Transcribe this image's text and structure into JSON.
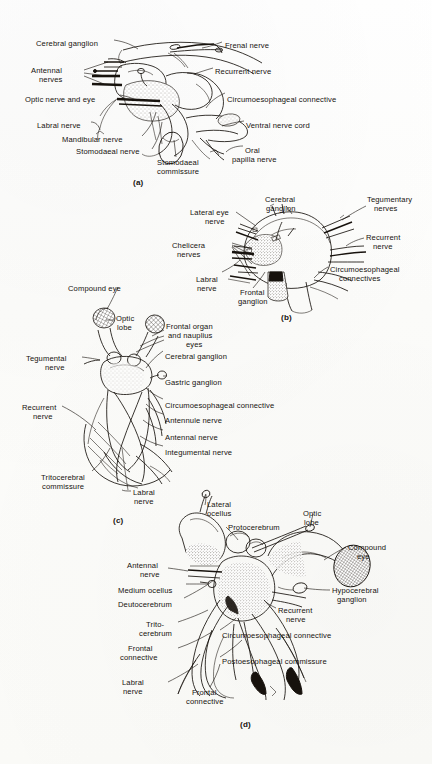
{
  "figure": {
    "background_color": "#fdfdfb",
    "ink_color": "#17120d",
    "type": "scientific-illustration-plate",
    "panel_count": 4
  },
  "panels": [
    {
      "letter": "(a)",
      "letter_x": 133,
      "letter_y": 178,
      "labels": [
        {
          "text": "Cerebral ganglion",
          "x": 36,
          "y": 39,
          "align": "left"
        },
        {
          "text": "Frenal nerve",
          "x": 225,
          "y": 41,
          "align": "left"
        },
        {
          "text": "Antennal",
          "x": 31,
          "y": 66,
          "align": "left"
        },
        {
          "text": "nerves",
          "x": 39,
          "y": 75,
          "align": "left"
        },
        {
          "text": "Recurrent nerve",
          "x": 215,
          "y": 67,
          "align": "left"
        },
        {
          "text": "Optic nerve and eye",
          "x": 25,
          "y": 95,
          "align": "left"
        },
        {
          "text": "Circumoesophageal connective",
          "x": 227,
          "y": 95,
          "align": "left"
        },
        {
          "text": "Labral nerve",
          "x": 37,
          "y": 121,
          "align": "left"
        },
        {
          "text": "Ventral nerve cord",
          "x": 246,
          "y": 121,
          "align": "left"
        },
        {
          "text": "Mandibular nerve",
          "x": 62,
          "y": 135,
          "align": "left"
        },
        {
          "text": "Stomodaeal nerve",
          "x": 76,
          "y": 147,
          "align": "left"
        },
        {
          "text": "Stomodaeal",
          "x": 157,
          "y": 158,
          "align": "left"
        },
        {
          "text": "commissure",
          "x": 157,
          "y": 167,
          "align": "left"
        },
        {
          "text": "Oral",
          "x": 245,
          "y": 146,
          "align": "left"
        },
        {
          "text": "papilla nerve",
          "x": 232,
          "y": 155,
          "align": "left"
        }
      ]
    },
    {
      "letter": "(b)",
      "letter_x": 281,
      "letter_y": 313,
      "labels": [
        {
          "text": "Cerebral",
          "x": 265,
          "y": 195,
          "align": "left"
        },
        {
          "text": "ganglion",
          "x": 266,
          "y": 204,
          "align": "left"
        },
        {
          "text": "Tegumentary",
          "x": 367,
          "y": 195,
          "align": "left"
        },
        {
          "text": "nerves",
          "x": 374,
          "y": 204,
          "align": "left"
        },
        {
          "text": "Lateral eye",
          "x": 190,
          "y": 208,
          "align": "left"
        },
        {
          "text": "nerve",
          "x": 205,
          "y": 217,
          "align": "left"
        },
        {
          "text": "Recurrent",
          "x": 366,
          "y": 233,
          "align": "left"
        },
        {
          "text": "nerve",
          "x": 373,
          "y": 242,
          "align": "left"
        },
        {
          "text": "Chelicera",
          "x": 172,
          "y": 241,
          "align": "left"
        },
        {
          "text": "nerves",
          "x": 177,
          "y": 250,
          "align": "left"
        },
        {
          "text": "Circumoesophageal",
          "x": 330,
          "y": 265,
          "align": "left"
        },
        {
          "text": "connectives",
          "x": 339,
          "y": 274,
          "align": "left"
        },
        {
          "text": "Labral",
          "x": 196,
          "y": 275,
          "align": "left"
        },
        {
          "text": "nerve",
          "x": 197,
          "y": 284,
          "align": "left"
        },
        {
          "text": "Frontal",
          "x": 240,
          "y": 288,
          "align": "left"
        },
        {
          "text": "ganglion",
          "x": 238,
          "y": 297,
          "align": "left"
        }
      ]
    },
    {
      "letter": "(c)",
      "letter_x": 113,
      "letter_y": 516,
      "labels": [
        {
          "text": "Compound eye",
          "x": 68,
          "y": 284,
          "align": "left"
        },
        {
          "text": "Optic",
          "x": 116,
          "y": 314,
          "align": "left"
        },
        {
          "text": "lobe",
          "x": 117,
          "y": 323,
          "align": "left"
        },
        {
          "text": "Frontal organ",
          "x": 166,
          "y": 322,
          "align": "left"
        },
        {
          "text": "and nauplius",
          "x": 168,
          "y": 331,
          "align": "left"
        },
        {
          "text": "eyes",
          "x": 186,
          "y": 340,
          "align": "left"
        },
        {
          "text": "Tegumental",
          "x": 26,
          "y": 354,
          "align": "left"
        },
        {
          "text": "nerve",
          "x": 45,
          "y": 363,
          "align": "left"
        },
        {
          "text": "Cerebral ganglion",
          "x": 165,
          "y": 352,
          "align": "left"
        },
        {
          "text": "Gastric ganglion",
          "x": 165,
          "y": 378,
          "align": "left"
        },
        {
          "text": "Circumoesophageal connective",
          "x": 165,
          "y": 401,
          "align": "left"
        },
        {
          "text": "Recurrent",
          "x": 22,
          "y": 403,
          "align": "left"
        },
        {
          "text": "nerve",
          "x": 33,
          "y": 412,
          "align": "left"
        },
        {
          "text": "Antennule nerve",
          "x": 165,
          "y": 416,
          "align": "left"
        },
        {
          "text": "Antennal nerve",
          "x": 165,
          "y": 433,
          "align": "left"
        },
        {
          "text": "Integumental nerve",
          "x": 165,
          "y": 448,
          "align": "left"
        },
        {
          "text": "Tritocerebral",
          "x": 41,
          "y": 473,
          "align": "left"
        },
        {
          "text": "commissure",
          "x": 42,
          "y": 482,
          "align": "left"
        },
        {
          "text": "Labral",
          "x": 133,
          "y": 488,
          "align": "left"
        },
        {
          "text": "nerve",
          "x": 134,
          "y": 497,
          "align": "left"
        }
      ]
    },
    {
      "letter": "(d)",
      "letter_x": 240,
      "letter_y": 720,
      "labels": [
        {
          "text": "Lateral",
          "x": 207,
          "y": 500,
          "align": "left"
        },
        {
          "text": "ocellus",
          "x": 207,
          "y": 509,
          "align": "left"
        },
        {
          "text": "Optic",
          "x": 303,
          "y": 509,
          "align": "left"
        },
        {
          "text": "lobe",
          "x": 304,
          "y": 518,
          "align": "left"
        },
        {
          "text": "Protocerebrum",
          "x": 228,
          "y": 523,
          "align": "left"
        },
        {
          "text": "Compound",
          "x": 348,
          "y": 543,
          "align": "left"
        },
        {
          "text": "eye",
          "x": 357,
          "y": 552,
          "align": "left"
        },
        {
          "text": "Antennal",
          "x": 127,
          "y": 561,
          "align": "left"
        },
        {
          "text": "nerve",
          "x": 140,
          "y": 570,
          "align": "left"
        },
        {
          "text": "Medium ocellus",
          "x": 118,
          "y": 586,
          "align": "left"
        },
        {
          "text": "Hypocerebral",
          "x": 332,
          "y": 586,
          "align": "left"
        },
        {
          "text": "ganglion",
          "x": 337,
          "y": 595,
          "align": "left"
        },
        {
          "text": "Deutocerebrum",
          "x": 118,
          "y": 600,
          "align": "left"
        },
        {
          "text": "Recurrent",
          "x": 278,
          "y": 606,
          "align": "left"
        },
        {
          "text": "nerve",
          "x": 286,
          "y": 615,
          "align": "left"
        },
        {
          "text": "Trito-",
          "x": 146,
          "y": 620,
          "align": "left"
        },
        {
          "text": "cerebrum",
          "x": 139,
          "y": 629,
          "align": "left"
        },
        {
          "text": "Circumoesophageal connective",
          "x": 222,
          "y": 631,
          "align": "left"
        },
        {
          "text": "Frontal",
          "x": 128,
          "y": 644,
          "align": "left"
        },
        {
          "text": "connective",
          "x": 120,
          "y": 653,
          "align": "left"
        },
        {
          "text": "Postoesophageal commissure",
          "x": 222,
          "y": 657,
          "align": "left"
        },
        {
          "text": "Labral",
          "x": 122,
          "y": 678,
          "align": "left"
        },
        {
          "text": "nerve",
          "x": 123,
          "y": 687,
          "align": "left"
        },
        {
          "text": "Frontal",
          "x": 192,
          "y": 688,
          "align": "left"
        },
        {
          "text": "connective",
          "x": 186,
          "y": 697,
          "align": "left"
        }
      ]
    }
  ]
}
